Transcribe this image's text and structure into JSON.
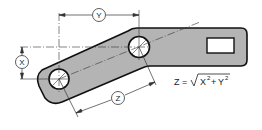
{
  "diagram": {
    "colors": {
      "part_fill": "#b4b4b4",
      "outline": "#111111",
      "dimension_line": "#333333",
      "background": "#ffffff"
    },
    "dimensions": {
      "y_label": "Y",
      "x_label": "X",
      "z_label": "Z"
    },
    "formula": {
      "lhs": "Z =",
      "radicand_a": "X",
      "radicand_exp_a": "2",
      "plus": "+",
      "radicand_b": "Y",
      "radicand_exp_b": "2"
    },
    "features": [
      {
        "name": "lower-hole",
        "type": "circle"
      },
      {
        "name": "upper-hole",
        "type": "circle"
      },
      {
        "name": "rectangular-slot",
        "type": "rectangle"
      }
    ]
  }
}
